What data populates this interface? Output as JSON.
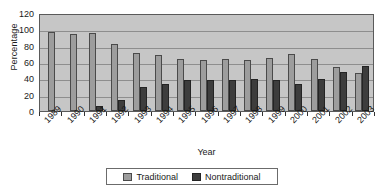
{
  "chart_data": {
    "type": "bar",
    "title": "",
    "xlabel": "Year",
    "ylabel": "Percentage",
    "ylim": [
      0,
      120
    ],
    "yticks": [
      0,
      20,
      40,
      60,
      80,
      100,
      120
    ],
    "grid": true,
    "legend_position": "bottom",
    "categories": [
      "1989",
      "1990",
      "1991",
      "1992",
      "1993",
      "1994",
      "1995",
      "1996",
      "1997",
      "1998",
      "1999",
      "2000",
      "2001",
      "2002",
      "2003"
    ],
    "series": [
      {
        "name": "Traditional",
        "color": "#9d9d9d",
        "values": [
          97,
          94,
          95,
          82,
          71,
          68,
          64,
          63,
          64,
          63,
          65,
          70,
          64,
          54,
          47
        ]
      },
      {
        "name": "Nontraditional",
        "color": "#3d3d3d",
        "values": [
          0,
          0,
          6,
          13,
          30,
          33,
          38,
          38,
          38,
          39,
          38,
          33,
          39,
          48,
          55
        ]
      }
    ]
  },
  "legend": {
    "items": [
      {
        "label": "Traditional",
        "color": "#9d9d9d"
      },
      {
        "label": "Nontraditional",
        "color": "#3d3d3d"
      }
    ]
  },
  "colors": {
    "plot_background": "#c6c6c6",
    "gridline": "#8e8e8e",
    "axis": "#333333",
    "page_background": "#ffffff"
  }
}
